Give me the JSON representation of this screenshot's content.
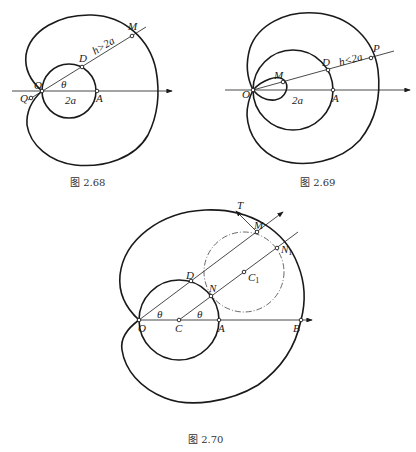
{
  "figures": [
    {
      "caption": "图 2.68",
      "labels": {
        "M": "M",
        "D": "D",
        "O": "O",
        "Q": "Q",
        "A": "A",
        "theta": "θ",
        "two_a": "2a",
        "h": "h>2a"
      }
    },
    {
      "caption": "图 2.69",
      "labels": {
        "M": "M",
        "D": "D",
        "O": "O",
        "P": "P",
        "A": "A",
        "two_a": "2a",
        "h": "h<2a"
      }
    },
    {
      "caption": "图 2.70",
      "labels": {
        "T": "T",
        "M": "M",
        "N1": "N",
        "N1_sub": "1",
        "D": "D",
        "N": "N",
        "C1": "C",
        "C1_sub": "1",
        "O": "O",
        "C": "C",
        "A": "A",
        "B": "B",
        "theta1": "θ",
        "theta2": "θ"
      }
    }
  ]
}
